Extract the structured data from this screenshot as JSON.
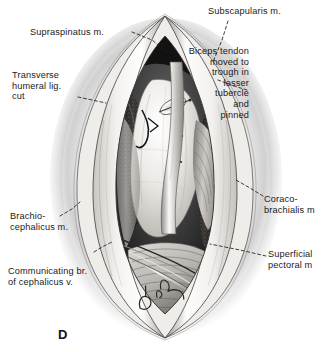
{
  "figure": {
    "letter": "D",
    "signature": "D. Lee",
    "background_color": "#ffffff",
    "ink_color": "#1a1a1a"
  },
  "labels": [
    {
      "id": "supraspinatus",
      "text": "Supraspinatus m.",
      "align": "left",
      "x": 30,
      "y": 27
    },
    {
      "id": "subscapularis",
      "text": "Subscapularis m.",
      "align": "left",
      "x": 208,
      "y": 6
    },
    {
      "id": "biceps-tendon",
      "text": "Biceps tendon\nmoved to\ntrough in\nlesser\ntubercle\nand\npinned",
      "align": "right",
      "x": 249,
      "y": 46
    },
    {
      "id": "transverse-humeral-lig",
      "text": "Transverse\nhumeral lig.\ncut",
      "align": "left",
      "x": 12,
      "y": 70
    },
    {
      "id": "brachiocephalicus",
      "text": "Brachio-\ncephalicus m.",
      "align": "left",
      "x": 10,
      "y": 211
    },
    {
      "id": "coracobrachialis",
      "text": "Coraco-\nbrachialis m",
      "align": "left",
      "x": 264,
      "y": 194
    },
    {
      "id": "communicating-branch",
      "text": "Communicating br.\nof cephalicus v.",
      "align": "left",
      "x": 8,
      "y": 266
    },
    {
      "id": "superficial-pectoral",
      "text": "Superficial\npectoral m",
      "align": "left",
      "x": 268,
      "y": 249
    }
  ],
  "leaders": [
    {
      "id": "leader-supraspinatus",
      "points": "132,32 152,40 168,53"
    },
    {
      "id": "leader-subscapularis",
      "points": "228,21 222,40 213,62"
    },
    {
      "id": "leader-biceps-tendon",
      "points": "247,90 234,86 218,80"
    },
    {
      "id": "leader-transverse-lig",
      "points": "78,97 92,100 106,103"
    },
    {
      "id": "leader-brachiocephalicus",
      "points": "60,216 72,209 80,202"
    },
    {
      "id": "leader-coracobrachialis",
      "points": "263,196 250,188 236,180"
    },
    {
      "id": "leader-communicating",
      "points": "94,252 102,247 112,242"
    },
    {
      "id": "leader-superficial-pect",
      "points": "266,256 240,250 210,244"
    }
  ]
}
